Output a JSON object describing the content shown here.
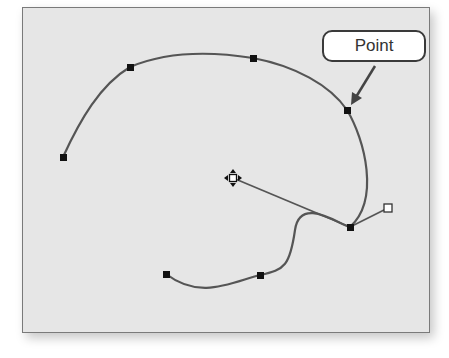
{
  "callout": {
    "label": "Point"
  },
  "colors": {
    "background": "#e6e6e6",
    "frame_border": "#7a7a7a",
    "path": "#555555",
    "anchor": "#111111",
    "handle_line": "#555555",
    "arrow": "#444444"
  },
  "path": {
    "anchors": [
      {
        "name": "anchor-1",
        "x": 63,
        "y": 157
      },
      {
        "name": "anchor-2",
        "x": 130,
        "y": 67
      },
      {
        "name": "anchor-3",
        "x": 253,
        "y": 58
      },
      {
        "name": "anchor-4",
        "x": 347,
        "y": 110
      },
      {
        "name": "anchor-5-selected",
        "x": 350,
        "y": 227
      },
      {
        "name": "anchor-6",
        "x": 260,
        "y": 275
      },
      {
        "name": "anchor-7",
        "x": 166,
        "y": 274
      }
    ],
    "direction_handles": [
      {
        "name": "direction-point-left",
        "x": 233,
        "y": 178
      },
      {
        "name": "direction-point-right",
        "x": 388,
        "y": 208
      }
    ]
  }
}
